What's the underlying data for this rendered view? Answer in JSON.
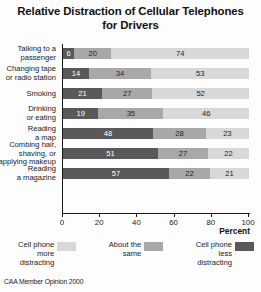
{
  "source_note": "CAA Member Opinion 2000",
  "chart_data": {
    "type": "bar",
    "subtype": "stacked-horizontal-100pct",
    "title": "Relative Distraction of Cellular Telephones for Drivers",
    "title_lines": [
      "Relative Distraction of Cellular Telephones",
      "for Drivers"
    ],
    "xlabel": "Percent",
    "ylabel": "",
    "xlim": [
      0,
      100
    ],
    "xticks": [
      0,
      20,
      40,
      60,
      80,
      100
    ],
    "xticklabels": [
      "0",
      "20",
      "40",
      "60",
      "80",
      "100"
    ],
    "grid": false,
    "legend_position": "bottom",
    "categories": [
      "Talking to a passenger",
      "Changing tape or radio station",
      "Smoking",
      "Drinking or eating",
      "Reading a map",
      "Combing hair, shaving, or applying makeup",
      "Reading a magazine"
    ],
    "category_lines": [
      [
        "Talking to a",
        "passenger"
      ],
      [
        "Changing tape",
        "or radio station"
      ],
      [
        "Smoking"
      ],
      [
        "Drinking",
        "or eating"
      ],
      [
        "Reading",
        "a map"
      ],
      [
        "Combing hair,",
        "shaving, or",
        "applying makeup"
      ],
      [
        "Reading",
        "a magazine"
      ]
    ],
    "series": [
      {
        "name": "Cell phone less distracting",
        "color": "#595959",
        "values": [
          6,
          14,
          21,
          19,
          48,
          51,
          57
        ]
      },
      {
        "name": "About the same",
        "color": "#a8a8a8",
        "values": [
          20,
          34,
          27,
          35,
          28,
          27,
          22
        ]
      },
      {
        "name": "Cell phone more distracting",
        "color": "#d8d8d8",
        "values": [
          74,
          53,
          52,
          46,
          23,
          22,
          21
        ]
      }
    ],
    "rows": [
      {
        "label_lines": [
          "Talking to a",
          "passenger"
        ],
        "segments": [
          {
            "value": 6,
            "tone": "dark"
          },
          {
            "value": 20,
            "tone": "mid"
          },
          {
            "value": 74,
            "tone": "light"
          }
        ]
      },
      {
        "label_lines": [
          "Changing tape",
          "or radio station"
        ],
        "segments": [
          {
            "value": 14,
            "tone": "dark"
          },
          {
            "value": 34,
            "tone": "mid"
          },
          {
            "value": 53,
            "tone": "light"
          }
        ]
      },
      {
        "label_lines": [
          "Smoking"
        ],
        "segments": [
          {
            "value": 21,
            "tone": "dark"
          },
          {
            "value": 27,
            "tone": "mid"
          },
          {
            "value": 52,
            "tone": "light"
          }
        ]
      },
      {
        "label_lines": [
          "Drinking",
          "or eating"
        ],
        "segments": [
          {
            "value": 19,
            "tone": "dark"
          },
          {
            "value": 35,
            "tone": "mid"
          },
          {
            "value": 46,
            "tone": "light"
          }
        ]
      },
      {
        "label_lines": [
          "Reading",
          "a map"
        ],
        "segments": [
          {
            "value": 48,
            "tone": "dark"
          },
          {
            "value": 28,
            "tone": "mid"
          },
          {
            "value": 23,
            "tone": "light"
          }
        ]
      },
      {
        "label_lines": [
          "Combing hair,",
          "shaving, or",
          "applying makeup"
        ],
        "segments": [
          {
            "value": 51,
            "tone": "dark"
          },
          {
            "value": 27,
            "tone": "mid"
          },
          {
            "value": 22,
            "tone": "light"
          }
        ]
      },
      {
        "label_lines": [
          "Reading",
          "a magazine"
        ],
        "segments": [
          {
            "value": 57,
            "tone": "dark"
          },
          {
            "value": 22,
            "tone": "mid"
          },
          {
            "value": 21,
            "tone": "light"
          }
        ]
      }
    ],
    "legend": [
      {
        "label_lines": [
          "Cell phone",
          "more",
          "distracting"
        ],
        "tone": "light",
        "color": "#d8d8d8"
      },
      {
        "label_lines": [
          "About the",
          "same"
        ],
        "tone": "mid",
        "color": "#a8a8a8"
      },
      {
        "label_lines": [
          "Cell phone",
          "less",
          "distracting"
        ],
        "tone": "dark",
        "color": "#595959"
      }
    ],
    "colors": {
      "more_distracting": "#d8d8d8",
      "about_the_same": "#a8a8a8",
      "less_distracting": "#595959",
      "axis": "#1a1a1a",
      "background": "#fdfdfd"
    }
  }
}
